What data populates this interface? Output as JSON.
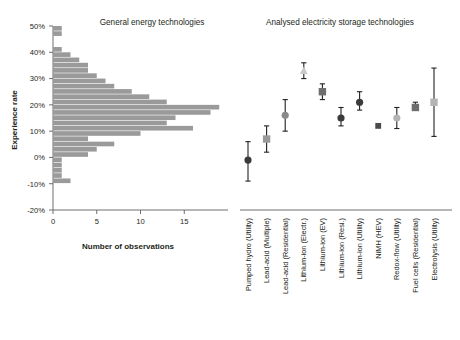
{
  "figure": {
    "panel_left_title": "General energy technologies",
    "panel_right_title": "Analysed electricity storage technologies",
    "ylabel": "Experience rate",
    "xlabel_left": "Number of observations"
  },
  "axes": {
    "y_ticks": [
      "-20%",
      "-10%",
      "0%",
      "10%",
      "20%",
      "30%",
      "40%",
      "50%"
    ],
    "y_values": [
      -20,
      -10,
      0,
      10,
      20,
      30,
      40,
      50
    ],
    "ylim": [
      -20,
      50
    ],
    "x_ticks_left": [
      "0",
      "5",
      "10",
      "15"
    ],
    "x_values_left": [
      0,
      5,
      10,
      15
    ],
    "xlim_left": [
      0,
      20
    ]
  },
  "colors": {
    "bar": "#9a9a9a",
    "axis": "#6d6e71",
    "text": "#231f20",
    "marker_dark": "#3b3b3b",
    "marker_mid": "#6e6e6e",
    "marker_light": "#b4b4b4",
    "marker_lighter": "#c9c9c9"
  },
  "chart_data": {
    "type": "bar",
    "title": "General energy technologies",
    "subtitle": "Analysed electricity storage technologies",
    "xlabel": "Number of observations",
    "ylabel": "Experience rate",
    "ylim": [
      -20,
      50
    ],
    "xlim": [
      0,
      20
    ],
    "grid": false,
    "legend": "none",
    "orientation": "horizontal",
    "histogram": {
      "bin_width": 2,
      "bin_centers": [
        49,
        47,
        45,
        43,
        41,
        39,
        37,
        35,
        33,
        31,
        29,
        27,
        25,
        23,
        21,
        19,
        17,
        15,
        13,
        11,
        9,
        7,
        5,
        3,
        1,
        -1,
        -3,
        -5,
        -7,
        -9
      ],
      "bin_labels": [
        "48-50%",
        "46-48%",
        "44-46%",
        "42-44%",
        "40-42%",
        "38-40%",
        "36-38%",
        "34-36%",
        "32-34%",
        "30-32%",
        "28-30%",
        "26-28%",
        "24-26%",
        "22-24%",
        "20-22%",
        "18-20%",
        "16-18%",
        "14-16%",
        "12-14%",
        "10-12%",
        "8-10%",
        "6-8%",
        "4-6%",
        "2-4%",
        "0-2%",
        "-2-0%",
        "-4--2%",
        "-6--4%",
        "-8--6%",
        "-10--8%"
      ],
      "counts": [
        1,
        1,
        0,
        0,
        1,
        2,
        3,
        4,
        4,
        5,
        6,
        7,
        9,
        11,
        13,
        19,
        18,
        14,
        13,
        16,
        10,
        4,
        7,
        5,
        4,
        1,
        1,
        1,
        1,
        2
      ]
    },
    "technologies": {
      "categories": [
        "Pumped hydro (Utility)",
        "Lead-acid (Multiple)",
        "Lead-acid (Residential)",
        "Lithium-ion (Electr.)",
        "Lithium-ion (EV)",
        "Lithium-ion (Resi.)",
        "Lithium-ion (Utility)",
        "NiMH (HEV)",
        "Redox-flow (Utility)",
        "Fuel cells (Residential)",
        "Electrolysis (Utility)"
      ],
      "values": [
        -1,
        7,
        16,
        33,
        25,
        15,
        21,
        12,
        15,
        19,
        21
      ],
      "err_low": [
        -9,
        2,
        10,
        30,
        22,
        12,
        18,
        12,
        11,
        18,
        8
      ],
      "err_high": [
        6,
        12,
        22,
        36,
        28,
        19,
        25,
        12,
        19,
        21,
        34
      ],
      "markers": [
        "circle",
        "square",
        "circle",
        "triangle",
        "square",
        "circle",
        "circle",
        "square-small",
        "circle",
        "square",
        "square"
      ],
      "marker_colors": [
        "#3b3b3b",
        "#9a9a9a",
        "#8a8a8a",
        "#c9c9c9",
        "#6e6e6e",
        "#3b3b3b",
        "#3b3b3b",
        "#4a4a4a",
        "#b4b4b4",
        "#6e6e6e",
        "#b4b4b4"
      ]
    }
  }
}
